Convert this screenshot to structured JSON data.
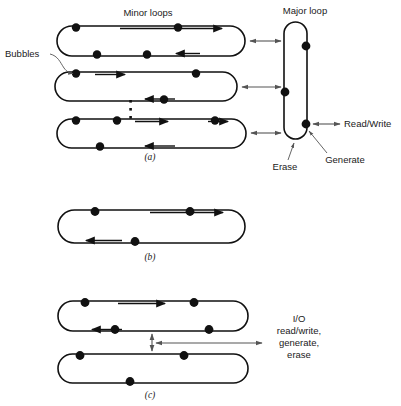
{
  "figure": {
    "labels": {
      "minor_loops": "Minor loops",
      "major_loop": "Major loop",
      "bubbles": "Bubbles",
      "read_write": "Read/Write",
      "erase": "Erase",
      "generate": "Generate",
      "io_line1": "I/O",
      "io_line2": "read/write,",
      "io_line3": "generate,",
      "io_line4": "erase"
    },
    "captions": {
      "a": "(a)",
      "b": "(b)",
      "c": "(c)"
    },
    "colors": {
      "ink": "#111111",
      "leader": "#555555",
      "background": "#ffffff"
    },
    "panel_a": {
      "minor_loops": [
        {
          "name": "minor-loop-1",
          "x1": 57,
          "x2": 245,
          "y1": 26,
          "y2": 56,
          "top_bubbles": [
            76,
            178
          ],
          "bottom_bubbles": [
            97,
            147
          ],
          "top_arrow_x": 214,
          "bottom_arrow_x": 185
        },
        {
          "name": "minor-loop-2",
          "x1": 55,
          "x2": 237,
          "y1": 72,
          "y2": 101,
          "top_bubbles": [
            76,
            196
          ],
          "bottom_bubbles": [
            164
          ],
          "top_arrow_x": 117,
          "bottom_arrow_x": 152
        },
        {
          "name": "minor-loop-3",
          "x1": 57,
          "x2": 246,
          "y1": 119,
          "y2": 148,
          "top_bubbles": [
            76,
            117,
            215
          ],
          "bottom_bubbles": [
            100
          ],
          "top_arrow_x": 160,
          "bottom_arrow_x": 160
        }
      ],
      "major_loop": {
        "x1": 284,
        "x2": 307,
        "y1": 22,
        "y2": 139,
        "right_bubbles": [
          46,
          124
        ],
        "left_bubbles": [
          92
        ]
      },
      "connectors": [
        {
          "name": "connector-loop-1",
          "y": 41,
          "x1": 247,
          "x2": 283
        },
        {
          "name": "connector-loop-2",
          "y": 87,
          "x1": 239,
          "x2": 283
        },
        {
          "name": "connector-loop-3",
          "y": 133,
          "x1": 248,
          "x2": 283
        }
      ],
      "ellipsis_x": 131,
      "ellipsis_y": [
        101,
        109,
        117
      ]
    },
    "panel_b": {
      "loop": {
        "name": "loop-b",
        "x1": 58,
        "x2": 245,
        "y1": 210,
        "y2": 243,
        "top_bubbles": [
          95,
          190
        ],
        "bottom_bubbles": [
          135
        ],
        "top_arrow_x": 215,
        "bottom_arrow_x": 92
      }
    },
    "panel_c": {
      "loops": [
        {
          "name": "loop-c-top",
          "x1": 58,
          "x2": 248,
          "y1": 301,
          "y2": 331,
          "top_bubbles": [
            85,
            194
          ],
          "bottom_bubbles": [
            115,
            209
          ],
          "top_arrow_x": 155,
          "bottom_arrow_x": 92
        },
        {
          "name": "loop-c-bottom",
          "x1": 58,
          "x2": 248,
          "y1": 354,
          "y2": 383,
          "top_bubbles": [
            80,
            184
          ],
          "bottom_bubbles": [
            130
          ],
          "top_arrow_x": 0,
          "bottom_arrow_x": 0
        }
      ],
      "vertical_connector": {
        "x": 152,
        "y1": 332,
        "y2": 353
      },
      "io_arrow": {
        "y": 343,
        "x1": 154,
        "x2": 262
      }
    }
  }
}
